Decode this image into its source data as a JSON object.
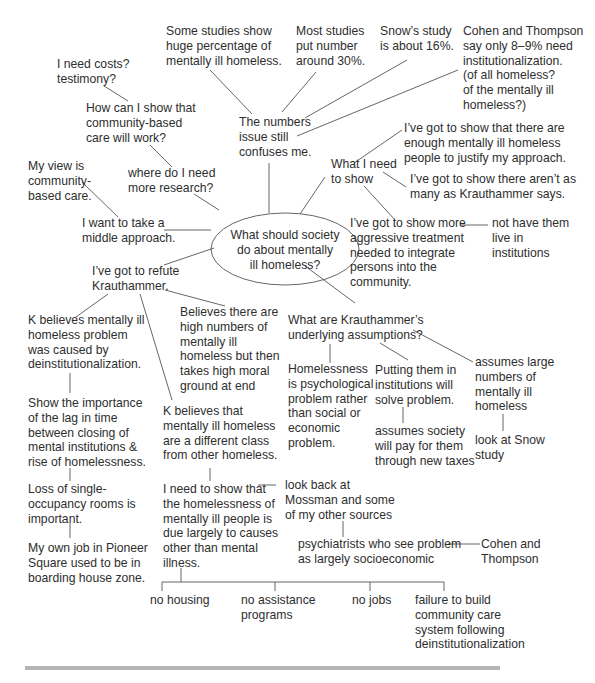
{
  "diagram": {
    "type": "cluster-map",
    "center": {
      "id": "center",
      "text": "What should society\ndo about mentally\nill homeless?"
    },
    "nodes": [
      {
        "id": "n_studies_huge",
        "text": "Some studies show\nhuge percentage of\nmentally ill homeless."
      },
      {
        "id": "n_most_studies",
        "text": "Most studies\nput number\naround 30%."
      },
      {
        "id": "n_snow",
        "text": "Snow’s study\nis about 16%."
      },
      {
        "id": "n_cohen",
        "text": "Cohen and Thompson\nsay only 8–9% need\ninstitutionalization.\n(of all homeless?\nof the mentally ill\nhomeless?)"
      },
      {
        "id": "n_costs",
        "text": "I need costs?\ntestimony?"
      },
      {
        "id": "n_how_show",
        "text": "How can I show that\ncommunity-based\ncare will work?"
      },
      {
        "id": "n_numbers_issue",
        "text": "The numbers\nissue still\nconfuses me."
      },
      {
        "id": "n_enough",
        "text": "I’ve got to show that there are\nenough mentally ill homeless\npeople to justify my approach."
      },
      {
        "id": "n_what_need",
        "text": "What I need\nto show"
      },
      {
        "id": "n_arent_many",
        "text": "I’ve got to show there aren’t as\nmany as Krauthammer says."
      },
      {
        "id": "n_my_view",
        "text": "My view is\ncommunity-\nbased care."
      },
      {
        "id": "n_where_research",
        "text": "where do I need\nmore research?"
      },
      {
        "id": "n_middle",
        "text": "I want to take a\nmiddle approach."
      },
      {
        "id": "n_aggressive",
        "text": "I’ve got to show more\naggressive treatment\nneeded to integrate\npersons into the\ncommunity."
      },
      {
        "id": "n_not_institutions",
        "text": "not have them\nlive in\ninstitutions"
      },
      {
        "id": "n_refute",
        "text": "I’ve got to refute\nKrauthammer."
      },
      {
        "id": "n_k_deinst",
        "text": "K believes mentally ill\nhomeless problem\nwas caused by\ndeinstitutionalization."
      },
      {
        "id": "n_believes_high",
        "text": "Believes there are\nhigh numbers of\nmentally ill\nhomeless but then\ntakes high moral\nground at end"
      },
      {
        "id": "n_assumptions",
        "text": "What are Krauthammer’s\nunderlying assumptions?"
      },
      {
        "id": "n_lag",
        "text": "Show the importance\nof the lag in time\nbetween closing of\nmental institutions &\nrise of homelessness."
      },
      {
        "id": "n_k_diff_class",
        "text": "K believes that\nmentally ill homeless\nare a different class\nfrom other homeless."
      },
      {
        "id": "n_psych",
        "text": "Homelessness\nis psychological\nproblem rather\nthan social or\neconomic\nproblem."
      },
      {
        "id": "n_putting",
        "text": "Putting them in\ninstitutions will\nsolve problem."
      },
      {
        "id": "n_assumes_large",
        "text": "assumes large\nnumbers of\nmentally ill\nhomeless"
      },
      {
        "id": "n_society_pay",
        "text": "assumes society\nwill pay for them\nthrough new taxes"
      },
      {
        "id": "n_look_snow",
        "text": "look at Snow\nstudy"
      },
      {
        "id": "n_sro",
        "text": "Loss of single-\noccupancy rooms is\nimportant."
      },
      {
        "id": "n_need_show",
        "text": "I need to show that\nthe homelessness of\nmentally ill people is\ndue largely to causes\nother than mental\nillness."
      },
      {
        "id": "n_mossman",
        "text": "look back at\nMossman and some\nof my other sources"
      },
      {
        "id": "n_psychiatrists",
        "text": "psychiatrists who see problem\nas largely socioeconomic"
      },
      {
        "id": "n_cohen_thompson",
        "text": "Cohen and\nThompson"
      },
      {
        "id": "n_pioneer",
        "text": "My own job in Pioneer\nSquare used to be in\nboarding house zone."
      },
      {
        "id": "n_no_housing",
        "text": "no housing"
      },
      {
        "id": "n_no_assistance",
        "text": "no assistance\nprograms"
      },
      {
        "id": "n_no_jobs",
        "text": "no jobs"
      },
      {
        "id": "n_failure",
        "text": "failure to build\ncommunity care\nsystem following\ndeinstitutionalization"
      }
    ],
    "edges": [
      [
        "center",
        "n_numbers_issue"
      ],
      [
        "center",
        "n_what_need"
      ],
      [
        "center",
        "n_where_research"
      ],
      [
        "center",
        "n_middle"
      ],
      [
        "center",
        "n_refute"
      ],
      [
        "center",
        "n_assumptions"
      ],
      [
        "n_numbers_issue",
        "n_studies_huge"
      ],
      [
        "n_numbers_issue",
        "n_most_studies"
      ],
      [
        "n_numbers_issue",
        "n_snow"
      ],
      [
        "n_numbers_issue",
        "n_cohen"
      ],
      [
        "n_costs",
        "n_how_show"
      ],
      [
        "n_how_show",
        "n_where_research"
      ],
      [
        "n_my_view",
        "n_middle"
      ],
      [
        "n_what_need",
        "n_enough"
      ],
      [
        "n_what_need",
        "n_arent_many"
      ],
      [
        "n_what_need",
        "n_aggressive"
      ],
      [
        "n_aggressive",
        "n_not_institutions"
      ],
      [
        "n_refute",
        "n_k_deinst"
      ],
      [
        "n_refute",
        "n_k_diff_class"
      ],
      [
        "n_refute",
        "n_believes_high"
      ],
      [
        "n_k_deinst",
        "n_lag"
      ],
      [
        "n_lag",
        "n_sro"
      ],
      [
        "n_sro",
        "n_pioneer"
      ],
      [
        "n_k_diff_class",
        "n_need_show"
      ],
      [
        "n_need_show",
        "n_mossman"
      ],
      [
        "n_mossman",
        "n_psychiatrists"
      ],
      [
        "n_psychiatrists",
        "n_cohen_thompson"
      ],
      [
        "n_need_show",
        "n_no_housing"
      ],
      [
        "n_need_show",
        "n_no_assistance"
      ],
      [
        "n_need_show",
        "n_no_jobs"
      ],
      [
        "n_need_show",
        "n_failure"
      ],
      [
        "n_assumptions",
        "n_psych"
      ],
      [
        "n_assumptions",
        "n_putting"
      ],
      [
        "n_assumptions",
        "n_assumes_large"
      ],
      [
        "n_putting",
        "n_society_pay"
      ],
      [
        "n_assumes_large",
        "n_look_snow"
      ]
    ]
  },
  "colors": {
    "text": "#2e2e2e",
    "lines": "#555555",
    "footer_rule": "#b5b5b5"
  }
}
